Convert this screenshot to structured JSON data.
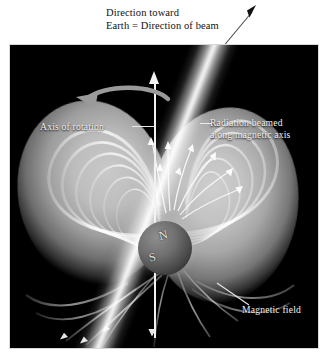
{
  "figure": {
    "title_line1": "Direction toward",
    "title_line2": "Earth = Direction of beam"
  },
  "labels": {
    "axis_of_rotation": "Axis of rotation",
    "radiation_beam_line1": "Radiation beamed",
    "radiation_beam_line2": "along magnetic axis",
    "magnetic_field": "Magnetic field"
  },
  "star": {
    "north_pole": "N",
    "south_pole": "S"
  },
  "icons": {
    "beam_direction_arrow": "arrow-up-right-icon",
    "rotation_direction_arrow": "curved-rotation-arrow-icon",
    "axis_arrow": "arrow-up-icon",
    "particle_flow_arrows": "particle-arrow-icon"
  },
  "colors": {
    "background": "#ffffff",
    "panel": "#000000",
    "beam": "#ffffff",
    "lobe": "#c2c2c2",
    "label_text": "#f0f0f0",
    "caption_text": "#111111",
    "star_body": "#6f6f6f"
  }
}
